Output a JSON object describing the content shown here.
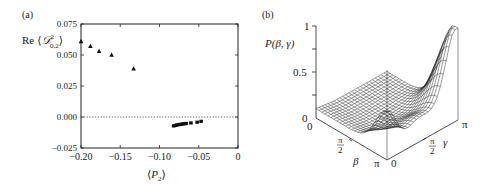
{
  "figure": {
    "panel_a_label": "(a)",
    "panel_b_label": "(b)"
  },
  "chart_data": [
    {
      "type": "scatter",
      "panel": "(a)",
      "xlabel": "⟨P₂⟩",
      "ylabel": "Re ⟨𝒟²₀,₂⟩",
      "xlim": [
        -0.2,
        0
      ],
      "ylim": [
        -0.025,
        0.075
      ],
      "xticks": [
        "−0.20",
        "−0.15",
        "−0.10",
        "−0.05",
        "0"
      ],
      "yticks": [
        "−0.025",
        "0.000",
        "0.025",
        "0.050",
        "0.075"
      ],
      "reference_line": {
        "y": 0.0,
        "style": "dotted"
      },
      "series": [
        {
          "name": "triangles",
          "marker": "triangle",
          "x": [
            -0.2,
            -0.188,
            -0.177,
            -0.161,
            -0.133
          ],
          "y": [
            0.061,
            0.057,
            0.053,
            0.05,
            0.039
          ]
        },
        {
          "name": "squares",
          "marker": "square",
          "x": [
            -0.082,
            -0.08,
            -0.078,
            -0.076,
            -0.074,
            -0.072,
            -0.07,
            -0.068,
            -0.066,
            -0.06,
            -0.052,
            -0.047
          ],
          "y": [
            -0.0072,
            -0.0068,
            -0.0065,
            -0.0062,
            -0.006,
            -0.0058,
            -0.0056,
            -0.0054,
            -0.0052,
            -0.0048,
            -0.0042,
            -0.0035
          ]
        }
      ]
    },
    {
      "type": "surface",
      "panel": "(b)",
      "zlabel": "P(β, γ)",
      "xlabel": "β",
      "ylabel": "γ",
      "zticks": [
        "0",
        "0.5",
        "1"
      ],
      "beta_ticks": [
        "0",
        "π/2",
        "π"
      ],
      "gamma_ticks": [
        "0",
        "π/2",
        "π"
      ],
      "zlim": [
        0,
        1
      ],
      "description": "Wireframe surface: low ridge (~0.1) along β at γ=0 rising to ~0.5 peak at β=π,γ=0; saddle near γ≈π/2; rising to ~1.0 at β=π, γ=π"
    }
  ],
  "axes_a": {
    "ylabel_text": "Re",
    "ylabel_symbol": "𝒟",
    "ylabel_sup": "2",
    "ylabel_sub": "0,2",
    "xlabel_symbol": "P",
    "xlabel_sub": "2"
  },
  "axes_b": {
    "zlabel": "P(β, γ)",
    "z_tick_0": "0",
    "z_tick_05": "0.5",
    "z_tick_1": "1",
    "beta_0": "0",
    "beta_half_num": "π",
    "beta_half_den": "2",
    "beta_pi": "π",
    "beta_label": "β",
    "gamma_0": "0",
    "gamma_half_num": "π",
    "gamma_half_den": "2",
    "gamma_pi": "π",
    "gamma_label": "γ"
  }
}
